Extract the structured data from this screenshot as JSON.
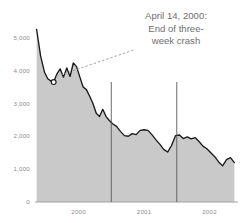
{
  "chart_data": {
    "type": "area",
    "title": "",
    "subtitle": "",
    "xlabel": "",
    "ylabel": "",
    "ylim": [
      0,
      5600
    ],
    "xlim": [
      1999.55,
      2002.62
    ],
    "grid": false,
    "legend": null,
    "y_ticks": [
      {
        "value": 5000,
        "label": "5,000"
      },
      {
        "value": 4000,
        "label": "4,000"
      },
      {
        "value": 3000,
        "label": "3,000"
      },
      {
        "value": 2000,
        "label": "2,000"
      },
      {
        "value": 1000,
        "label": "1,000"
      },
      {
        "value": 0,
        "label": "0"
      }
    ],
    "x_ticks": [
      {
        "value": 2000.2,
        "label": "2000"
      },
      {
        "value": 2001.2,
        "label": "2001"
      },
      {
        "value": 2002.2,
        "label": "2002"
      }
    ],
    "year_divider_lines": [
      2000.7,
      2001.7
    ],
    "series": [
      {
        "name": "Index level",
        "fill_color": "#c9c9c9",
        "line_color": "#1a1a1a",
        "x": [
          1999.56,
          1999.62,
          1999.68,
          1999.73,
          1999.78,
          1999.82,
          1999.87,
          1999.92,
          1999.97,
          2000.02,
          2000.07,
          2000.12,
          2000.17,
          2000.22,
          2000.27,
          2000.32,
          2000.37,
          2000.42,
          2000.47,
          2000.52,
          2000.57,
          2000.62,
          2000.67,
          2000.72,
          2000.78,
          2000.84,
          2000.9,
          2000.96,
          2001.02,
          2001.08,
          2001.14,
          2001.2,
          2001.26,
          2001.32,
          2001.38,
          2001.44,
          2001.5,
          2001.56,
          2001.62,
          2001.68,
          2001.74,
          2001.8,
          2001.86,
          2001.92,
          2001.98,
          2002.04,
          2002.1,
          2002.16,
          2002.22,
          2002.28,
          2002.34,
          2002.4,
          2002.46,
          2002.52,
          2002.58
        ],
        "y": [
          5250,
          4450,
          3950,
          3750,
          3680,
          3650,
          3900,
          4050,
          3800,
          4080,
          3820,
          4230,
          4120,
          3800,
          3500,
          3420,
          3220,
          3000,
          2700,
          2600,
          2820,
          2600,
          2480,
          2380,
          2300,
          2150,
          2020,
          2000,
          2080,
          2050,
          2180,
          2200,
          2180,
          2050,
          1900,
          1760,
          1600,
          1520,
          1720,
          2020,
          2040,
          1930,
          1980,
          1920,
          1960,
          1840,
          1700,
          1620,
          1500,
          1380,
          1220,
          1100,
          1290,
          1350,
          1200
        ]
      }
    ],
    "markers": [
      {
        "name": "april-14-2000-marker",
        "x": 1999.82,
        "y": 3650,
        "style": "open-circle"
      }
    ],
    "annotations": [
      {
        "name": "crash-annotation",
        "lines": [
          "April 14, 2000:",
          "End of three-",
          "week crash"
        ],
        "leader_from": {
          "x": 1999.86,
          "y": 3820
        },
        "leader_to": {
          "x": 2001.06,
          "y": 4640
        },
        "leader_style": "dashed"
      }
    ]
  }
}
